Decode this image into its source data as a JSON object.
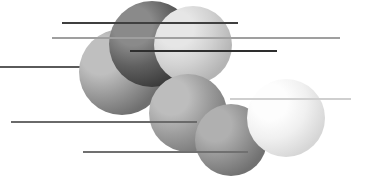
{
  "artwork": {
    "title": "Abstract Composition of Spheres and Horizontal Rules",
    "width": 366,
    "height": 186,
    "background_color": "#ffffff"
  },
  "chart_data": {
    "type": "scatter",
    "xlabel": "",
    "ylabel": "",
    "xlim": [
      0,
      366
    ],
    "ylim": [
      0,
      186
    ],
    "grid": false,
    "legend": "none",
    "series": [
      {
        "name": "spheres",
        "points": [
          {
            "label": "sphere-front-left-gray",
            "x": 122,
            "y": 72,
            "r": 43
          },
          {
            "label": "sphere-dark-charcoal",
            "x": 152,
            "y": 44,
            "r": 43
          },
          {
            "label": "sphere-pale-gray-top",
            "x": 193,
            "y": 45,
            "r": 39
          },
          {
            "label": "sphere-mid-gray-center",
            "x": 188,
            "y": 113,
            "r": 39
          },
          {
            "label": "sphere-mid-dark-bottom",
            "x": 231,
            "y": 140,
            "r": 36
          },
          {
            "label": "sphere-white-right",
            "x": 286,
            "y": 118,
            "r": 39
          }
        ]
      },
      {
        "name": "rules",
        "points": [
          {
            "label": "rule-top-dark",
            "x1": 62,
            "x2": 238,
            "y": 23
          },
          {
            "label": "rule-second-light",
            "x1": 52,
            "x2": 340,
            "y": 38
          },
          {
            "label": "rule-third-dark",
            "x1": 130,
            "x2": 277,
            "y": 51
          },
          {
            "label": "rule-fourth-left",
            "x1": 0,
            "x2": 150,
            "y": 67
          },
          {
            "label": "rule-fifth-pale",
            "x1": 230,
            "x2": 351,
            "y": 99
          },
          {
            "label": "rule-sixth-mid",
            "x1": 11,
            "x2": 197,
            "y": 122
          },
          {
            "label": "rule-bottom",
            "x1": 83,
            "x2": 248,
            "y": 152
          }
        ]
      }
    ]
  },
  "spheres": [
    {
      "name": "sphere-front-left-gray",
      "cx": 122,
      "cy": 72,
      "r": 43,
      "highlight_x": 101,
      "highlight_y": 55,
      "highlight_color": "#bfbfbf",
      "mid_color": "#9a9a9a",
      "edge_color": "#6f6f6f"
    },
    {
      "name": "sphere-dark-charcoal",
      "cx": 152,
      "cy": 44,
      "r": 43,
      "highlight_x": 133,
      "highlight_y": 26,
      "highlight_color": "#8a8a8a",
      "mid_color": "#606060",
      "edge_color": "#3a3a3a"
    },
    {
      "name": "sphere-pale-gray-top",
      "cx": 193,
      "cy": 45,
      "r": 39,
      "highlight_x": 176,
      "highlight_y": 29,
      "highlight_color": "#e6e6e6",
      "mid_color": "#d2d2d2",
      "edge_color": "#b4b4b4"
    },
    {
      "name": "sphere-mid-gray-center",
      "cx": 188,
      "cy": 113,
      "r": 39,
      "highlight_x": 171,
      "highlight_y": 97,
      "highlight_color": "#bdbdbd",
      "mid_color": "#9e9e9e",
      "edge_color": "#7c7c7c"
    },
    {
      "name": "sphere-mid-dark-bottom",
      "cx": 231,
      "cy": 140,
      "r": 36,
      "highlight_x": 215,
      "highlight_y": 125,
      "highlight_color": "#b0b0b0",
      "mid_color": "#939393",
      "edge_color": "#717171"
    },
    {
      "name": "sphere-white-right",
      "cx": 286,
      "cy": 118,
      "r": 39,
      "highlight_x": 270,
      "highlight_y": 102,
      "highlight_color": "#fdfdfd",
      "mid_color": "#f0f0f0",
      "edge_color": "#d6d6d6"
    }
  ],
  "rules": [
    {
      "name": "rule-top-dark",
      "x1": 62,
      "x2": 238,
      "y": 23,
      "color": "#3f3f3f",
      "width": 1.6,
      "layer": "over"
    },
    {
      "name": "rule-second-light",
      "x1": 52,
      "x2": 340,
      "y": 38,
      "color": "#9f9f9f",
      "width": 1.2,
      "layer": "over"
    },
    {
      "name": "rule-third-dark",
      "x1": 130,
      "x2": 277,
      "y": 51,
      "color": "#2e2e2e",
      "width": 1.8,
      "layer": "over"
    },
    {
      "name": "rule-fourth-left",
      "x1": 0,
      "x2": 150,
      "y": 67,
      "color": "#5a5a5a",
      "width": 1.2,
      "layer": "under"
    },
    {
      "name": "rule-fifth-pale",
      "x1": 230,
      "x2": 351,
      "y": 99,
      "color": "#cfcfcf",
      "width": 1.2,
      "layer": "over"
    },
    {
      "name": "rule-sixth-mid",
      "x1": 11,
      "x2": 197,
      "y": 122,
      "color": "#6a6a6a",
      "width": 1.3,
      "layer": "over"
    },
    {
      "name": "rule-bottom",
      "x1": 83,
      "x2": 248,
      "y": 152,
      "color": "#707070",
      "width": 1.3,
      "layer": "over"
    }
  ]
}
